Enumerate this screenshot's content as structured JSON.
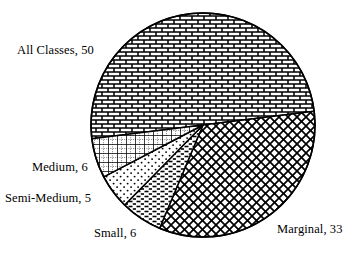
{
  "chart_data": {
    "type": "pie",
    "title": "",
    "subtitle": "",
    "xlabel": "",
    "ylabel": "",
    "legend_position": "none",
    "grid": false,
    "total": 100,
    "categories": [
      "All Classes",
      "Marginal",
      "Small",
      "Semi-Medium",
      "Medium"
    ],
    "values": [
      50,
      33,
      6,
      5,
      6
    ],
    "labels": [
      "All Classes, 50",
      "Marginal, 33",
      "Small, 6",
      "Semi-Medium, 5",
      "Medium, 6"
    ],
    "slices": [
      {
        "name": "All Classes",
        "value": 50,
        "label": "All Classes, 50",
        "pattern": "brick",
        "start_angle": 173,
        "end_angle": 353,
        "fill": "#ffffff",
        "stroke": "#000000"
      },
      {
        "name": "Marginal",
        "value": 33,
        "label": "Marginal, 33",
        "pattern": "diagonal-crosshatch",
        "start_angle": 353,
        "end_angle": 472.8,
        "fill": "#ffffff",
        "stroke": "#000000"
      },
      {
        "name": "Small",
        "value": 6,
        "label": "Small, 6",
        "pattern": "dashed-horizontal",
        "start_angle": 112.8,
        "end_angle": 134.4,
        "fill": "#ffffff",
        "stroke": "#000000"
      },
      {
        "name": "Semi-Medium",
        "value": 5,
        "label": "Semi-Medium, 5",
        "pattern": "dotted",
        "start_angle": 134.4,
        "end_angle": 152.4,
        "fill": "#ffffff",
        "stroke": "#000000"
      },
      {
        "name": "Medium",
        "value": 6,
        "label": "Medium, 6",
        "pattern": "grid-plaid",
        "start_angle": 152.4,
        "end_angle": 173,
        "fill": "#ffffff",
        "stroke": "#000000"
      }
    ],
    "geometry": {
      "center_x": 203,
      "center_y": 125,
      "radius": 112
    },
    "colors": {
      "background": "#ffffff",
      "outline": "#000000",
      "text": "#000000"
    }
  }
}
